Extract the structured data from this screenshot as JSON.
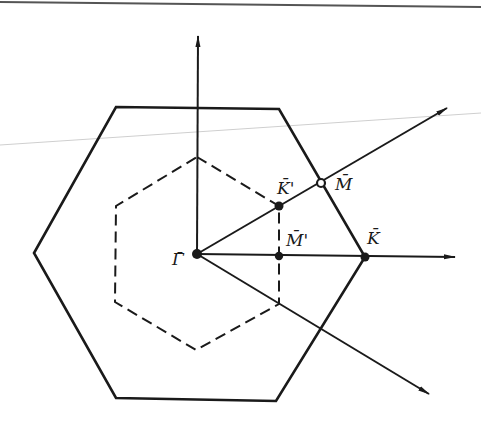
{
  "figure": {
    "type": "brillouin-zone-diagram",
    "stroke_color": "#1a1a1a",
    "guide_line_color": "#c8c8c8"
  },
  "points": {
    "gamma": {
      "label": "Γ̄",
      "x": 197,
      "y": 254,
      "marker": "filled"
    },
    "k": {
      "label": "K̄",
      "x": 365,
      "y": 257,
      "marker": "filled"
    },
    "m": {
      "label": "M̄",
      "x": 321,
      "y": 183,
      "marker": "open"
    },
    "k_prime": {
      "label": "K̄'",
      "x": 279,
      "y": 206,
      "marker": "filled"
    },
    "m_prime": {
      "label": "M̄'",
      "x": 279,
      "y": 256,
      "marker": "filled"
    }
  },
  "outer_hexagon": {
    "style": "solid",
    "vertices": [
      [
        116,
        107
      ],
      [
        279,
        109
      ],
      [
        365,
        257
      ],
      [
        276,
        401
      ],
      [
        116,
        398
      ],
      [
        34,
        253
      ]
    ]
  },
  "inner_hexagon": {
    "style": "dashed",
    "vertices": [
      [
        197,
        157
      ],
      [
        279,
        206
      ],
      [
        279,
        304
      ],
      [
        196,
        350
      ],
      [
        115,
        302
      ],
      [
        116,
        206
      ]
    ]
  },
  "axes": [
    {
      "name": "vertical",
      "from": [
        197,
        254
      ],
      "to": [
        198,
        36
      ]
    },
    {
      "name": "horizontal",
      "from": [
        197,
        254
      ],
      "to": [
        455,
        257
      ]
    },
    {
      "name": "diagonal-up",
      "from": [
        197,
        254
      ],
      "to": [
        447,
        108
      ]
    },
    {
      "name": "diagonal-down",
      "from": [
        197,
        254
      ],
      "to": [
        429,
        394
      ]
    }
  ]
}
